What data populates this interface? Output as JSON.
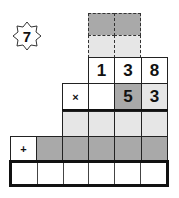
{
  "problem": {
    "number": "7",
    "operator_multiply": "×",
    "operator_add": "+",
    "multiplicand": [
      "1",
      "3",
      "8"
    ],
    "multiplier": [
      "5",
      "3"
    ]
  },
  "colors": {
    "dark_gray": "#a9a9a9",
    "light_gray": "#e6e6e6",
    "white": "#ffffff",
    "border": "#222222"
  }
}
